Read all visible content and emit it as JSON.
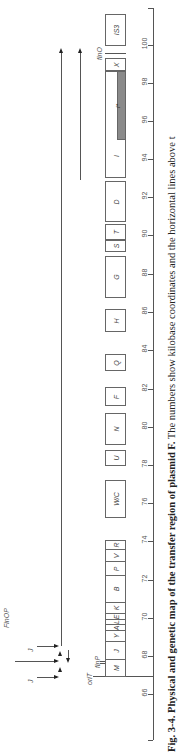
{
  "figure": {
    "caption_label": "Fig. 3-4.",
    "caption_title": "Physical and genetic map of the transfer region of plasmid F.",
    "caption_text": "The numbers show kilobase coordinates and the horizontal lines above t",
    "orientation": "rotated 90° counterclockwise"
  },
  "axis": {
    "unit": "kb",
    "ticks": [
      "66",
      "68",
      "70",
      "72",
      "74",
      "76",
      "78",
      "80",
      "82",
      "84",
      "86",
      "88",
      "90",
      "92",
      "94",
      "96",
      "98",
      "100"
    ]
  },
  "markers": {
    "oriT": "oriT",
    "finP": "finP",
    "finO": "finO",
    "FinOP": "FinOP",
    "J_top": "J",
    "J_bottom": "J"
  },
  "genes": [
    {
      "label": "M"
    },
    {
      "label": "J"
    },
    {
      "label": "Y"
    },
    {
      "label": "A"
    },
    {
      "label": "L"
    },
    {
      "label": "E"
    },
    {
      "label": "K"
    },
    {
      "label": "B"
    },
    {
      "label": "P"
    },
    {
      "label": "V"
    },
    {
      "label": "R"
    },
    {
      "label": "W/C"
    },
    {
      "label": "U"
    },
    {
      "label": "N"
    },
    {
      "label": "F"
    },
    {
      "label": "Q"
    },
    {
      "label": "H"
    },
    {
      "label": "G"
    },
    {
      "label": "S"
    },
    {
      "label": "T"
    },
    {
      "label": "D"
    },
    {
      "label": "I"
    },
    {
      "label": "I*"
    },
    {
      "label": "X"
    },
    {
      "label": "IS3"
    }
  ],
  "colors": {
    "line": "#555555",
    "gray_region": "#8a8a8a",
    "text": "#222222"
  }
}
